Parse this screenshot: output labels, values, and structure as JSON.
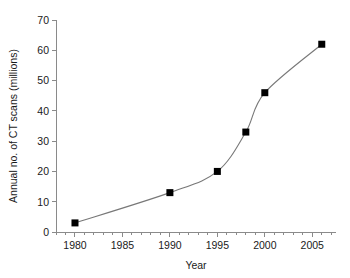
{
  "chart_data": {
    "type": "line",
    "title": "",
    "xlabel": "Year",
    "ylabel": "Annual no. of CT scans (millions)",
    "x": [
      1980,
      1990,
      1995,
      1998,
      2000,
      2006
    ],
    "values": [
      3,
      13,
      20,
      33,
      46,
      62
    ],
    "series": [
      {
        "name": "Annual no. of CT scans (millions)",
        "values": [
          3,
          13,
          20,
          33,
          46,
          62
        ]
      }
    ],
    "xlim": [
      1978,
      2007.5
    ],
    "ylim": [
      0,
      70
    ],
    "x_tick_labels": [
      "1980",
      "1985",
      "1990",
      "1995",
      "2000",
      "2005"
    ],
    "x_tick_values": [
      1980,
      1985,
      1990,
      1995,
      2000,
      2005
    ],
    "x_minor_tick_interval": 1,
    "y_tick_labels": [
      "0",
      "10",
      "20",
      "30",
      "40",
      "50",
      "60",
      "70"
    ],
    "y_tick_values": [
      0,
      10,
      20,
      30,
      40,
      50,
      60,
      70
    ],
    "grid": false,
    "legend": false,
    "legend_position": "none",
    "marker": "filled-square",
    "marker_color": "#000000",
    "line_color": "#787878",
    "axis_color": "#8a8a8a",
    "background_color": "#ffffff",
    "curve_smoothing": true
  }
}
